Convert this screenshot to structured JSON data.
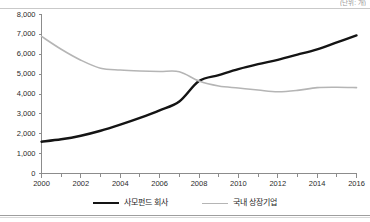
{
  "unit_note": "(단위: 개)",
  "legend": {
    "items": [
      {
        "label": "사모펀드 회사",
        "color": "#141414",
        "style": "thick"
      },
      {
        "label": "국내 상장기업",
        "color": "#b5b5b5",
        "style": "thin"
      }
    ]
  },
  "chart_data": {
    "type": "line",
    "title": "",
    "subtitle": "",
    "xlabel": "",
    "ylabel": "",
    "xlim": [
      2000,
      2016
    ],
    "ylim": [
      0,
      8000
    ],
    "ytick_step": 1000,
    "grid": false,
    "legend_position": "bottom",
    "x": [
      2000,
      2001,
      2002,
      2003,
      2004,
      2005,
      2006,
      2007,
      2008,
      2009,
      2010,
      2011,
      2012,
      2013,
      2014,
      2015,
      2016
    ],
    "xticklabels": [
      "2000",
      "",
      "2002",
      "",
      "2004",
      "",
      "2006",
      "",
      "2008",
      "",
      "2010",
      "",
      "2012",
      "",
      "2014",
      "",
      "2016"
    ],
    "xticklabels_major": [
      "2000",
      "2002",
      "2004",
      "2006",
      "2008",
      "2010",
      "2012",
      "2014",
      "2016"
    ],
    "yticklabels": [
      "0",
      "1,000",
      "2,000",
      "3,000",
      "4,000",
      "5,000",
      "6,000",
      "7,000",
      "8,000"
    ],
    "series": [
      {
        "name": "사모펀드 회사",
        "color": "#141414",
        "linewidth": 2.4,
        "values": [
          1600,
          1720,
          1900,
          2150,
          2460,
          2800,
          3180,
          3620,
          4650,
          4950,
          5250,
          5500,
          5720,
          5980,
          6250,
          6600,
          6950
        ]
      },
      {
        "name": "국내 상장기업",
        "color": "#b5b5b5",
        "linewidth": 1.6,
        "values": [
          6900,
          6250,
          5700,
          5300,
          5210,
          5160,
          5130,
          5120,
          4650,
          4400,
          4300,
          4200,
          4110,
          4180,
          4320,
          4340,
          4320
        ]
      }
    ]
  }
}
